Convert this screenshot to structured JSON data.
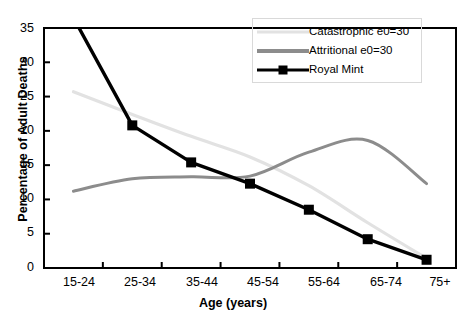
{
  "chart_data": {
    "type": "line",
    "title": "",
    "xlabel": "Age (years)",
    "ylabel": "Percentage of Adult Deaths",
    "categories": [
      "15-24",
      "25-34",
      "35-44",
      "45-54",
      "55-64",
      "65-74",
      "75+"
    ],
    "ylim": [
      0,
      35
    ],
    "yticks": [
      0,
      5,
      10,
      15,
      20,
      25,
      30,
      35
    ],
    "grid": false,
    "legend_position": "top-right",
    "series": [
      {
        "name": "Catastrophic e0=30",
        "color": "#e2e2e2",
        "style": "smooth-line",
        "marker": "none",
        "values": [
          25.7,
          22.4,
          19.2,
          16.2,
          12.0,
          6.6,
          1.4
        ]
      },
      {
        "name": "Attritional e0=30",
        "color": "#8c8c8c",
        "style": "smooth-line",
        "marker": "none",
        "values": [
          11.2,
          13.0,
          13.3,
          13.4,
          16.9,
          18.6,
          12.3
        ]
      },
      {
        "name": "Royal Mint",
        "color": "#000000",
        "style": "line",
        "marker": "square",
        "values": [
          36.5,
          20.8,
          15.4,
          12.3,
          8.5,
          4.2,
          1.2
        ],
        "note": "first point clipped above axis maximum"
      }
    ]
  },
  "axes": {
    "y_tick_labels": [
      "35",
      "30",
      "25",
      "20",
      "15",
      "10",
      "5",
      "0"
    ],
    "x_tick_labels": [
      "15-24",
      "25-34",
      "35-44",
      "45-54",
      "55-64",
      "65-74",
      "75+"
    ],
    "y_axis_title": "Percentage of Adult Deaths",
    "x_axis_title": "Age (years)"
  },
  "legend": {
    "items": [
      {
        "label": "Catastrophic e0=30",
        "color": "#e2e2e2",
        "marker": "none"
      },
      {
        "label": "Attritional e0=30",
        "color": "#8c8c8c",
        "marker": "none"
      },
      {
        "label": "Royal Mint",
        "color": "#000000",
        "marker": "square"
      }
    ]
  }
}
